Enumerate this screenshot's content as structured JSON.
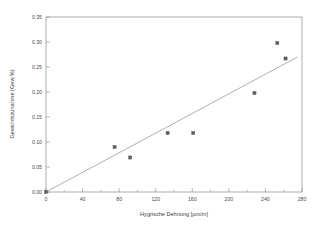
{
  "chart_data": {
    "type": "scatter",
    "title": "",
    "xlabel": "Hygrische Dehnung [µm/m]",
    "ylabel": "Gewichtszunahme (Gew.%)",
    "xlim": [
      0,
      280
    ],
    "ylim": [
      0,
      0.35
    ],
    "grid": false,
    "legend": null,
    "xticks": [
      0,
      40,
      80,
      120,
      160,
      200,
      240,
      280
    ],
    "xticklabels": [
      "0",
      "40",
      "80",
      "120",
      "160",
      "200",
      "240",
      "280"
    ],
    "yticks": [
      0.0,
      0.05,
      0.1,
      0.15,
      0.2,
      0.25,
      0.3,
      0.35
    ],
    "yticklabels": [
      "0.00",
      "0.05",
      "0.10",
      "0.15",
      "0.20",
      "0.25",
      "0.30",
      "0.35"
    ],
    "x_minor_tick_count": 1,
    "y_minor_tick_count": 0,
    "series": [
      {
        "name": "Messpunkte",
        "marker": "square",
        "color": "#5d5d5d",
        "points": [
          {
            "x": 0,
            "y": 0.0
          },
          {
            "x": 75,
            "y": 0.09
          },
          {
            "x": 92,
            "y": 0.069
          },
          {
            "x": 133,
            "y": 0.118
          },
          {
            "x": 161,
            "y": 0.118
          },
          {
            "x": 228,
            "y": 0.198
          },
          {
            "x": 253,
            "y": 0.298
          },
          {
            "x": 262,
            "y": 0.267
          }
        ]
      },
      {
        "name": "Regressionsgerade",
        "type": "line",
        "color": "#8e8e8e",
        "points": [
          {
            "x": 0,
            "y": 0.0
          },
          {
            "x": 275,
            "y": 0.27
          }
        ]
      }
    ]
  },
  "figure": {
    "background_color": "#ffffff",
    "axis_color": "#8a8a8a",
    "text_color": "#4a4a4a"
  }
}
